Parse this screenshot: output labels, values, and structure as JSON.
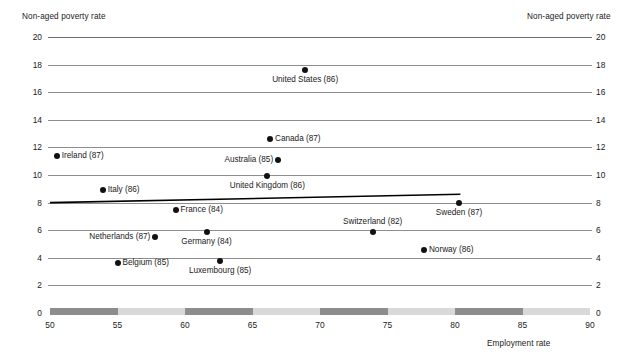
{
  "chart_data": {
    "type": "scatter",
    "title": "",
    "xlabel": "Employment rate",
    "ylabel": "Non-aged poverty rate",
    "ylabel_right": "Non-aged poverty rate",
    "xlim": [
      50,
      90
    ],
    "ylim": [
      0,
      20
    ],
    "xticks": [
      50,
      55,
      60,
      65,
      70,
      75,
      80,
      85,
      90
    ],
    "yticks": [
      0,
      2,
      4,
      6,
      8,
      10,
      12,
      14,
      16,
      18,
      20
    ],
    "grid": "horizontal",
    "legend": "none",
    "points": [
      {
        "label": "United States (86)",
        "x": 68.9,
        "y": 17.6,
        "label_pos": "below"
      },
      {
        "label": "Canada (87)",
        "x": 66.3,
        "y": 12.6,
        "label_pos": "right"
      },
      {
        "label": "Ireland (87)",
        "x": 50.5,
        "y": 11.4,
        "label_pos": "right"
      },
      {
        "label": "Australia (85)",
        "x": 66.9,
        "y": 11.1,
        "label_pos": "left"
      },
      {
        "label": "United Kingdom  (86)",
        "x": 66.1,
        "y": 9.9,
        "label_pos": "below"
      },
      {
        "label": "Italy (86)",
        "x": 53.9,
        "y": 8.9,
        "label_pos": "right"
      },
      {
        "label": "Sweden (87)",
        "x": 80.3,
        "y": 8.0,
        "label_pos": "below"
      },
      {
        "label": "France (84)",
        "x": 59.3,
        "y": 7.5,
        "label_pos": "right"
      },
      {
        "label": "Germany (84)",
        "x": 61.6,
        "y": 5.9,
        "label_pos": "below"
      },
      {
        "label": "Switzerland (82)",
        "x": 73.9,
        "y": 5.9,
        "label_pos": "above"
      },
      {
        "label": "Netherlands (87)",
        "x": 57.8,
        "y": 5.5,
        "label_pos": "left"
      },
      {
        "label": "Norway (86)",
        "x": 77.7,
        "y": 4.6,
        "label_pos": "right"
      },
      {
        "label": "Luxembourg (85)",
        "x": 62.6,
        "y": 3.8,
        "label_pos": "below"
      },
      {
        "label": "Belgium (85)",
        "x": 55.0,
        "y": 3.6,
        "label_pos": "right"
      }
    ],
    "trendline": {
      "x0": 50.0,
      "y0": 8.0,
      "x1": 80.4,
      "y1": 8.6
    },
    "xaxis_bands": [
      {
        "from": 50,
        "to": 55,
        "shade": "dark"
      },
      {
        "from": 55,
        "to": 60,
        "shade": "light"
      },
      {
        "from": 60,
        "to": 65,
        "shade": "dark"
      },
      {
        "from": 65,
        "to": 70,
        "shade": "light"
      },
      {
        "from": 70,
        "to": 75,
        "shade": "dark"
      },
      {
        "from": 75,
        "to": 80,
        "shade": "light"
      },
      {
        "from": 80,
        "to": 85,
        "shade": "dark"
      },
      {
        "from": 85,
        "to": 90,
        "shade": "light"
      }
    ],
    "colors": {
      "point": "#111111",
      "gridline": "#8e8e8e",
      "band_dark": "#8d8d8d",
      "band_light": "#d9d9d9",
      "trendline": "#000000"
    }
  }
}
